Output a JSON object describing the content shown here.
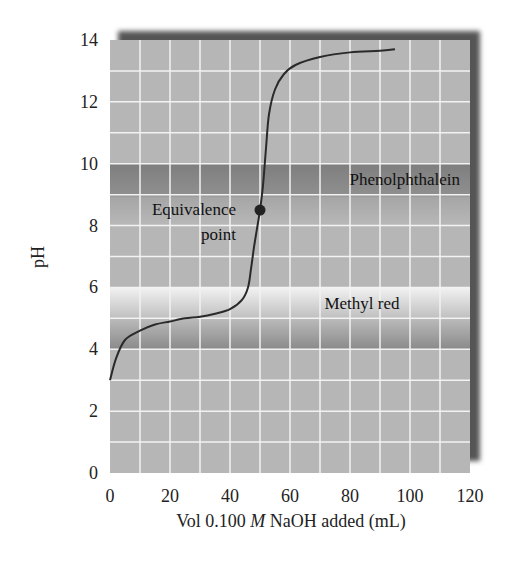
{
  "chart_data": {
    "type": "line",
    "title": "",
    "xlabel": "Vol 0.100 M NaOH added (mL)",
    "xlabel_parts": {
      "prefix": "Vol 0.100 ",
      "italic": "M",
      "suffix": " NaOH added (mL)"
    },
    "ylabel": "pH",
    "xlim": [
      0,
      120
    ],
    "ylim": [
      0,
      14
    ],
    "x_ticks": [
      0,
      20,
      40,
      60,
      80,
      100,
      120
    ],
    "y_ticks": [
      0,
      2,
      4,
      6,
      8,
      10,
      12,
      14
    ],
    "grid": {
      "on": true,
      "x_step": 10,
      "y_step": 1
    },
    "legend": null,
    "series": [
      {
        "name": "Titration curve",
        "x": [
          0,
          2,
          5,
          10,
          15,
          20,
          25,
          30,
          35,
          40,
          44,
          46,
          47,
          48,
          49,
          50,
          51,
          52,
          53,
          55,
          58,
          62,
          70,
          80,
          90,
          95
        ],
        "y": [
          3.0,
          3.7,
          4.3,
          4.6,
          4.8,
          4.9,
          5.0,
          5.05,
          5.15,
          5.3,
          5.6,
          6.0,
          6.6,
          7.3,
          7.9,
          8.5,
          9.3,
          10.5,
          11.6,
          12.4,
          12.9,
          13.2,
          13.45,
          13.6,
          13.65,
          13.7
        ]
      }
    ],
    "bands": [
      {
        "name": "Phenolphthalein",
        "ymin": 8,
        "ymax": 10,
        "label": "Phenolphthalein"
      },
      {
        "name": "Methyl red",
        "ymin": 4,
        "ymax": 6,
        "label": "Methyl red"
      }
    ],
    "annotations": [
      {
        "text": "Equivalence point",
        "lines": [
          "Equivalence",
          "point"
        ],
        "x": 50,
        "y": 8.5
      }
    ],
    "colors": {
      "plot_bg": "#b4b4b4",
      "grid": "#f0f0f0",
      "curve": "#2a2a2a",
      "band_dark": "#8a8a8a",
      "band_light": "#e4e4e4",
      "shadow": "#555555"
    }
  }
}
